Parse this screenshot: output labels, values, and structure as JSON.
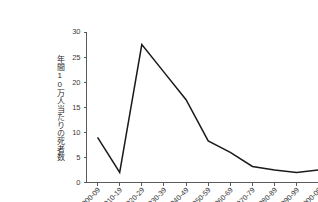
{
  "chart_data": {
    "type": "line",
    "title": "",
    "xlabel": "",
    "ylabel": "年間10万人当たりの死者数",
    "categories": [
      "1900-09",
      "1910-19",
      "1920-29",
      "1930-39",
      "1940-49",
      "1950-59",
      "1960-69",
      "1970-79",
      "1980-89",
      "1990-99",
      "2000-09",
      "2010-15"
    ],
    "values": [
      9,
      2,
      27.5,
      22,
      16.5,
      8.3,
      6,
      3.2,
      2.5,
      2,
      2.5,
      2.3
    ],
    "series": [
      {
        "name": "年間10万人当たりの死者数",
        "values": [
          9,
          2,
          27.5,
          22,
          16.5,
          8.3,
          6,
          3.2,
          2.5,
          2,
          2.5,
          2.3
        ]
      }
    ],
    "ylim": [
      0,
      30
    ],
    "yticks": [
      0,
      5,
      10,
      15,
      20,
      25,
      30
    ],
    "ytick_labels": [
      "0",
      "5",
      "10",
      "15",
      "20",
      "25",
      "30"
    ],
    "grid": false,
    "legend": false,
    "legend_position": "none",
    "line_color": "#1a1a1a",
    "axis_color": "#5a5a5a",
    "background_color": "#ffffff"
  }
}
